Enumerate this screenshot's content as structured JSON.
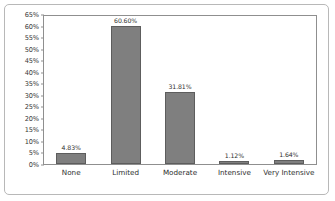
{
  "chart_data": {
    "type": "bar",
    "title": "",
    "xlabel": "",
    "ylabel": "",
    "categories": [
      "None",
      "Limited",
      "Moderate",
      "Intensive",
      "Very Intensive"
    ],
    "values": [
      4.83,
      60.6,
      31.81,
      1.12,
      1.64
    ],
    "data_labels": [
      "4.83%",
      "60.60%",
      "31.81%",
      "1.12%",
      "1.64%"
    ],
    "ylim": [
      0,
      65
    ],
    "ytick_step": 5,
    "ytick_labels": [
      "0%",
      "5%",
      "10%",
      "15%",
      "20%",
      "25%",
      "30%",
      "35%",
      "40%",
      "45%",
      "50%",
      "55%",
      "60%",
      "65%"
    ],
    "ytick_values": [
      0,
      5,
      10,
      15,
      20,
      25,
      30,
      35,
      40,
      45,
      50,
      55,
      60,
      65
    ],
    "grid": false,
    "legend": false,
    "bar_color": "#7f7f7f",
    "bar_border_color": "#5d5d5d",
    "frame_color": "#8f8f8f",
    "card_border_color": "#b8b8b8",
    "background": "#ffffff"
  }
}
